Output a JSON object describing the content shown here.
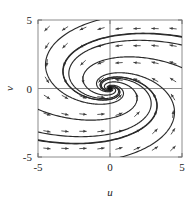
{
  "figure": {
    "kind": "phase-portrait",
    "background": "#ffffff",
    "frame_color": "#8c8c8c",
    "curve_color": "#2a2a2a",
    "arrow_color": "#3a3a3a",
    "equilibrium_color": "#111111"
  },
  "chart_data": {
    "type": "scatter",
    "title": "",
    "subtitle": "",
    "xlabel": "u",
    "ylabel": "v",
    "xlim": [
      -5,
      5
    ],
    "ylim": [
      -5,
      5
    ],
    "xticks": [
      -5,
      0,
      5
    ],
    "yticks": [
      -5,
      0,
      5
    ],
    "xticklabels": [
      "-5",
      "0",
      "5"
    ],
    "yticklabels": [
      "-5",
      "0",
      "5"
    ],
    "grid": false,
    "legend": null,
    "legend_position": "none",
    "annotations": [
      {
        "label": "equilibrium",
        "u": 0,
        "v": 0,
        "stability": "stable"
      }
    ],
    "equilibria": [
      {
        "u": 0,
        "v": 0,
        "type": "stable-spiral-node"
      }
    ],
    "vector_field": {
      "description": "Arrows point left in the upper half plane and right in the lower half plane, curving toward the origin.",
      "sample_spacing_u": 1.25,
      "sample_spacing_v": 1.25,
      "quadrant_directions": {
        "upper_left": "down-left",
        "upper_right": "left",
        "lower_left": "right",
        "lower_right": "up-right"
      }
    },
    "series": [
      {
        "name": "trajectory-1",
        "values": []
      },
      {
        "name": "trajectory-2",
        "values": []
      },
      {
        "name": "trajectory-3",
        "values": []
      },
      {
        "name": "trajectory-4",
        "values": []
      },
      {
        "name": "trajectory-5",
        "values": []
      },
      {
        "name": "trajectory-6",
        "values": []
      },
      {
        "name": "trajectory-7",
        "values": []
      },
      {
        "name": "trajectory-8",
        "values": []
      },
      {
        "name": "trajectory-9",
        "values": []
      },
      {
        "name": "trajectory-10",
        "values": []
      }
    ]
  },
  "axes": {
    "x": {
      "label": "u",
      "ticks": [
        {
          "value": -5,
          "text": "-5"
        },
        {
          "value": 0,
          "text": "0"
        },
        {
          "value": 5,
          "text": "5"
        }
      ]
    },
    "y": {
      "label": "v",
      "ticks": [
        {
          "value": 5,
          "text": "5"
        },
        {
          "value": 0,
          "text": "0"
        },
        {
          "value": -5,
          "text": "-5"
        }
      ]
    }
  }
}
